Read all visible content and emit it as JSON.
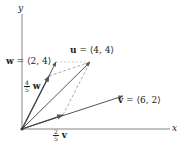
{
  "diagram": {
    "axes": {
      "x_label": "x",
      "y_label": "y"
    },
    "vectors": [
      {
        "name": "u",
        "label": "u = ⟨4, 4⟩",
        "bold": "u",
        "rest": " = ⟨4, 4⟩",
        "components": [
          4,
          4
        ]
      },
      {
        "name": "v",
        "label": "v = ⟨6, 2⟩",
        "bold": "v",
        "rest": " = ⟨6, 2⟩",
        "components": [
          6,
          2
        ]
      },
      {
        "name": "w",
        "label": "w = ⟨2, 4⟩",
        "bold": "w",
        "rest": " = ⟨2, 4⟩",
        "components": [
          2,
          4
        ]
      }
    ],
    "scaled": [
      {
        "name": "4/5 w",
        "num": "4",
        "den": "5",
        "vec": "w",
        "components": [
          1.6,
          3.2
        ]
      },
      {
        "name": "2/5 v",
        "num": "2",
        "den": "5",
        "vec": "v",
        "components": [
          2.4,
          0.8
        ]
      }
    ],
    "colors": {
      "axis": "#555555",
      "vector": "#555555",
      "dashed": "#777777",
      "text": "#222222"
    }
  }
}
